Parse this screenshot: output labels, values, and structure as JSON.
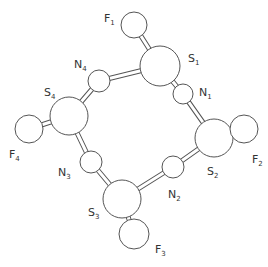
{
  "diagram": {
    "title": "",
    "type": "ball-and-stick molecular structure",
    "atoms": [
      {
        "id": "F1",
        "element": "F",
        "index": "1",
        "x": 134,
        "y": 25,
        "r": 13,
        "label_x": 104,
        "label_y": 22
      },
      {
        "id": "S1",
        "element": "S",
        "index": "1",
        "x": 160,
        "y": 66,
        "r": 20,
        "label_x": 188,
        "label_y": 62
      },
      {
        "id": "N1",
        "element": "N",
        "index": "1",
        "x": 183,
        "y": 94,
        "r": 10,
        "label_x": 199,
        "label_y": 96
      },
      {
        "id": "S2",
        "element": "S",
        "index": "2",
        "x": 214,
        "y": 138,
        "r": 19,
        "label_x": 207,
        "label_y": 175
      },
      {
        "id": "F2",
        "element": "F",
        "index": "2",
        "x": 244,
        "y": 129,
        "r": 14,
        "label_x": 252,
        "label_y": 163
      },
      {
        "id": "N2",
        "element": "N",
        "index": "2",
        "x": 173,
        "y": 167,
        "r": 11,
        "label_x": 168,
        "label_y": 198
      },
      {
        "id": "S3",
        "element": "S",
        "index": "3",
        "x": 122,
        "y": 199,
        "r": 19,
        "label_x": 88,
        "label_y": 216
      },
      {
        "id": "F3",
        "element": "F",
        "index": "3",
        "x": 134,
        "y": 234,
        "r": 15,
        "label_x": 155,
        "label_y": 253
      },
      {
        "id": "N3",
        "element": "N",
        "index": "3",
        "x": 91,
        "y": 162,
        "r": 11,
        "label_x": 58,
        "label_y": 176
      },
      {
        "id": "S4",
        "element": "S",
        "index": "4",
        "x": 69,
        "y": 116,
        "r": 19,
        "label_x": 44,
        "label_y": 96
      },
      {
        "id": "F4",
        "element": "F",
        "index": "4",
        "x": 29,
        "y": 129,
        "r": 14,
        "label_x": 9,
        "label_y": 158
      },
      {
        "id": "N4",
        "element": "N",
        "index": "4",
        "x": 99,
        "y": 81,
        "r": 11,
        "label_x": 74,
        "label_y": 68
      }
    ],
    "bonds": [
      [
        "F1",
        "S1"
      ],
      [
        "S1",
        "N1"
      ],
      [
        "N1",
        "S2"
      ],
      [
        "S2",
        "F2"
      ],
      [
        "S2",
        "N2"
      ],
      [
        "N2",
        "S3"
      ],
      [
        "S3",
        "F3"
      ],
      [
        "S3",
        "N3"
      ],
      [
        "N3",
        "S4"
      ],
      [
        "S4",
        "F4"
      ],
      [
        "S4",
        "N4"
      ],
      [
        "N4",
        "S1"
      ]
    ],
    "colors": {
      "background": "#ffffff",
      "outline": "#555555",
      "text": "#333333"
    }
  }
}
